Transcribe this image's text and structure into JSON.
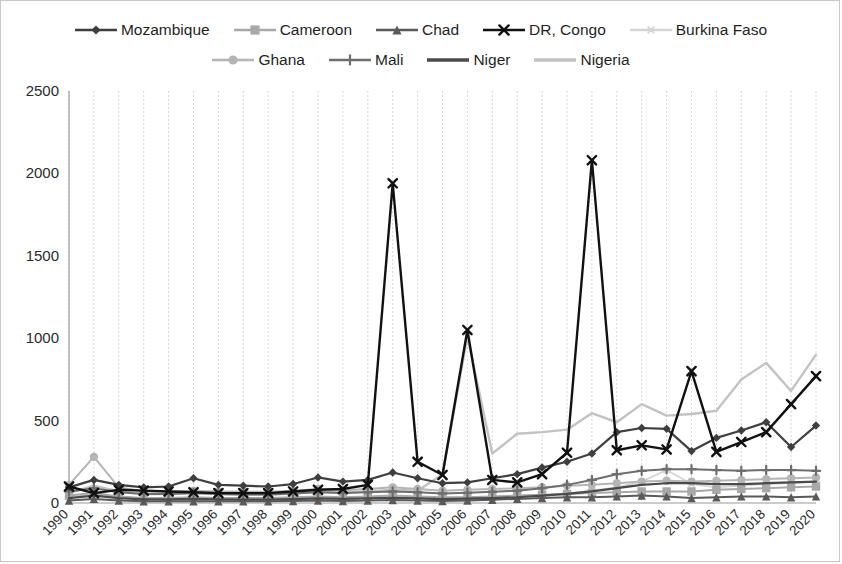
{
  "chart_data": {
    "type": "line",
    "title": "",
    "subtitle": "",
    "xlabel": "",
    "ylabel": "",
    "ylim": [
      0,
      2500
    ],
    "yticks": [
      0,
      500,
      1000,
      1500,
      2000,
      2500
    ],
    "grid": "vertical-dashed",
    "legend_position": "top",
    "x": [
      "1990",
      "1991",
      "1992",
      "1993",
      "1994",
      "1995",
      "1996",
      "1997",
      "1998",
      "1999",
      "2000",
      "2001",
      "2002",
      "2003",
      "2004",
      "2005",
      "2006",
      "2007",
      "2008",
      "2009",
      "2010",
      "2011",
      "2012",
      "2013",
      "2014",
      "2015",
      "2016",
      "2017",
      "2018",
      "2019",
      "2020"
    ],
    "categories": [
      "1990",
      "1991",
      "1992",
      "1993",
      "1994",
      "1995",
      "1996",
      "1997",
      "1998",
      "1999",
      "2000",
      "2001",
      "2002",
      "2003",
      "2004",
      "2005",
      "2006",
      "2007",
      "2008",
      "2009",
      "2010",
      "2011",
      "2012",
      "2013",
      "2014",
      "2015",
      "2016",
      "2017",
      "2018",
      "2019",
      "2020"
    ],
    "series": [
      {
        "name": "Mozambique",
        "color": "#3f3f3f",
        "marker": "diamond",
        "width": 2.2,
        "values": [
          95,
          140,
          110,
          95,
          100,
          150,
          110,
          105,
          100,
          115,
          155,
          130,
          140,
          185,
          150,
          120,
          125,
          150,
          175,
          215,
          250,
          300,
          430,
          455,
          450,
          315,
          395,
          440,
          490,
          340,
          470
        ]
      },
      {
        "name": "Cameroon",
        "color": "#a8a8a8",
        "marker": "square",
        "width": 2.0,
        "values": [
          45,
          60,
          40,
          30,
          30,
          35,
          30,
          30,
          30,
          35,
          40,
          35,
          40,
          45,
          40,
          35,
          35,
          40,
          45,
          50,
          55,
          60,
          65,
          70,
          70,
          70,
          80,
          85,
          90,
          95,
          100
        ]
      },
      {
        "name": "Chad",
        "color": "#5a5a5a",
        "marker": "triangle",
        "width": 2.0,
        "values": [
          15,
          25,
          15,
          10,
          10,
          10,
          10,
          10,
          10,
          12,
          15,
          12,
          15,
          18,
          15,
          12,
          15,
          20,
          25,
          30,
          35,
          35,
          40,
          45,
          40,
          30,
          35,
          40,
          40,
          35,
          40
        ]
      },
      {
        "name": "DR, Congo",
        "color": "#111111",
        "marker": "x",
        "width": 2.4,
        "values": [
          100,
          60,
          80,
          75,
          70,
          65,
          60,
          60,
          60,
          70,
          80,
          85,
          110,
          1940,
          250,
          170,
          1050,
          140,
          125,
          175,
          305,
          2080,
          320,
          350,
          325,
          800,
          310,
          370,
          430,
          600,
          770
        ]
      },
      {
        "name": "Burkina Faso",
        "color": "#d4d4d4",
        "marker": "asterisk",
        "width": 1.8,
        "values": [
          35,
          50,
          35,
          25,
          25,
          25,
          22,
          22,
          22,
          25,
          30,
          28,
          30,
          35,
          30,
          25,
          28,
          30,
          35,
          45,
          60,
          75,
          95,
          130,
          200,
          115,
          95,
          105,
          115,
          120,
          130
        ]
      },
      {
        "name": "Ghana",
        "color": "#b5b5b5",
        "marker": "circle",
        "width": 2.0,
        "values": [
          110,
          280,
          95,
          70,
          70,
          75,
          70,
          68,
          68,
          75,
          85,
          78,
          85,
          95,
          85,
          75,
          80,
          85,
          90,
          95,
          105,
          110,
          120,
          130,
          135,
          130,
          135,
          140,
          145,
          150,
          155
        ]
      },
      {
        "name": "Mali",
        "color": "#6e6e6e",
        "marker": "plus",
        "width": 2.0,
        "values": [
          70,
          90,
          65,
          55,
          55,
          60,
          55,
          52,
          52,
          58,
          65,
          60,
          65,
          70,
          65,
          58,
          62,
          68,
          75,
          90,
          110,
          140,
          175,
          195,
          205,
          205,
          200,
          195,
          200,
          200,
          195
        ]
      },
      {
        "name": "Niger",
        "color": "#4a4a4a",
        "marker": "none",
        "width": 2.2,
        "values": [
          30,
          45,
          30,
          22,
          22,
          25,
          22,
          20,
          20,
          24,
          28,
          25,
          28,
          32,
          28,
          24,
          26,
          30,
          35,
          45,
          55,
          70,
          90,
          110,
          120,
          120,
          115,
          115,
          120,
          125,
          130
        ]
      },
      {
        "name": "Nigeria",
        "color": "#c2c2c2",
        "marker": "none",
        "width": 2.4,
        "values": [
          60,
          105,
          70,
          55,
          55,
          60,
          55,
          52,
          52,
          58,
          70,
          62,
          70,
          80,
          75,
          175,
          1010,
          300,
          420,
          430,
          445,
          545,
          490,
          600,
          530,
          540,
          560,
          750,
          850,
          680,
          900
        ]
      }
    ]
  },
  "legend": {
    "rows": [
      [
        {
          "label": "Mozambique",
          "color": "#3f3f3f",
          "marker": "diamond"
        },
        {
          "label": "Cameroon",
          "color": "#a8a8a8",
          "marker": "square"
        },
        {
          "label": "Chad",
          "color": "#5a5a5a",
          "marker": "triangle"
        },
        {
          "label": "DR, Congo",
          "color": "#111111",
          "marker": "x"
        },
        {
          "label": "Burkina Faso",
          "color": "#d4d4d4",
          "marker": "asterisk"
        }
      ],
      [
        {
          "label": "Ghana",
          "color": "#b5b5b5",
          "marker": "circle"
        },
        {
          "label": "Mali",
          "color": "#6e6e6e",
          "marker": "plus"
        },
        {
          "label": "Niger",
          "color": "#4a4a4a",
          "marker": "none"
        },
        {
          "label": "Nigeria",
          "color": "#c2c2c2",
          "marker": "none"
        }
      ]
    ]
  },
  "colors": {
    "background": "#ffffff",
    "border": "#c9c9c9",
    "gridline": "#d6d6d6",
    "axis": "#9a9a9a",
    "text": "#2b2b2b"
  }
}
